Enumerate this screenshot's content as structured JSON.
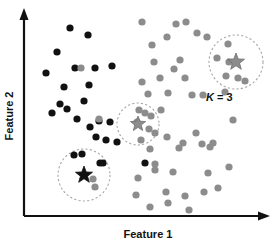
{
  "figure": {
    "title": "",
    "width": 276,
    "height": 244,
    "background": "#ffffff"
  },
  "axes": {
    "x_label": "Feature 1",
    "y_label": "Feature 2",
    "x_axis_color": "#111111",
    "y_axis_color": "#111111",
    "has_arrowheads": true,
    "has_ticks": false,
    "grid": false
  },
  "annotations": {
    "k_value": {
      "symbol": "K",
      "equals": " = ",
      "value": "3",
      "full_text": "K = 3",
      "x": 206,
      "y": 101
    }
  },
  "colors": {
    "cluster_a": "#111111",
    "cluster_b": "#8c8c8c",
    "centroid_a": "#111111",
    "centroid_b": "#8c8c8c",
    "circle_stroke": "#a8a8a8"
  },
  "chart_data": {
    "type": "scatter",
    "title": "",
    "xlabel": "Feature 1",
    "ylabel": "Feature 2",
    "xlim": [
      0,
      276
    ],
    "ylim": [
      0,
      244
    ],
    "grid": false,
    "legend": null,
    "annotations": [
      "K = 3"
    ],
    "series": [
      {
        "name": "cluster_a",
        "color": "#111111",
        "marker": "circle",
        "radius": 3.6,
        "points": [
          [
            70,
            28
          ],
          [
            88,
            35
          ],
          [
            57,
            52
          ],
          [
            46,
            73
          ],
          [
            75,
            68
          ],
          [
            95,
            68
          ],
          [
            112,
            66
          ],
          [
            64,
            87
          ],
          [
            89,
            85
          ],
          [
            60,
            104
          ],
          [
            67,
            109
          ],
          [
            84,
            101
          ],
          [
            52,
            113
          ],
          [
            77,
            119
          ],
          [
            90,
            127
          ],
          [
            99,
            121
          ],
          [
            110,
            122
          ],
          [
            96,
            137
          ],
          [
            106,
            140
          ],
          [
            117,
            142
          ],
          [
            82,
            154
          ],
          [
            103,
            163
          ],
          [
            145,
            163
          ]
        ]
      },
      {
        "name": "cluster_a_outlier_gray",
        "color": "#8c8c8c",
        "marker": "circle",
        "radius": 3.6,
        "points": [
          [
            81,
            68
          ],
          [
            99,
            119
          ],
          [
            93,
            179
          ]
        ]
      },
      {
        "name": "cluster_b",
        "color": "#8c8c8c",
        "marker": "circle",
        "radius": 3.6,
        "points": [
          [
            142,
            22
          ],
          [
            176,
            24
          ],
          [
            186,
            22
          ],
          [
            167,
            37
          ],
          [
            197,
            33
          ],
          [
            152,
            45
          ],
          [
            180,
            60
          ],
          [
            207,
            37
          ],
          [
            217,
            58
          ],
          [
            229,
            62
          ],
          [
            238,
            78
          ],
          [
            154,
            62
          ],
          [
            160,
            78
          ],
          [
            185,
            78
          ],
          [
            174,
            69
          ],
          [
            148,
            94
          ],
          [
            168,
            93
          ],
          [
            192,
            95
          ],
          [
            203,
            95
          ],
          [
            225,
            92
          ],
          [
            142,
            82
          ],
          [
            161,
            110
          ],
          [
            137,
            122
          ],
          [
            141,
            140
          ],
          [
            151,
            116
          ],
          [
            155,
            133
          ],
          [
            167,
            137
          ],
          [
            183,
            143
          ],
          [
            150,
            149
          ],
          [
            155,
            164
          ],
          [
            179,
            148
          ],
          [
            202,
            144
          ],
          [
            210,
            147
          ],
          [
            213,
            143
          ],
          [
            196,
            133
          ],
          [
            173,
            172
          ],
          [
            138,
            178
          ],
          [
            155,
            170
          ],
          [
            208,
            173
          ],
          [
            229,
            167
          ],
          [
            166,
            192
          ],
          [
            185,
            196
          ],
          [
            136,
            195
          ],
          [
            204,
            192
          ],
          [
            218,
            188
          ],
          [
            189,
            210
          ],
          [
            168,
            203
          ],
          [
            150,
            207
          ],
          [
            233,
            120
          ]
        ]
      }
    ],
    "centroids": [
      {
        "name": "centroid-bottom-left",
        "x": 84,
        "y": 175,
        "color": "#111111",
        "marker": "star",
        "size": 9,
        "circle_radius": 26
      },
      {
        "name": "centroid-middle",
        "x": 138,
        "y": 124,
        "color": "#8c8c8c",
        "marker": "star",
        "size": 8,
        "circle_radius": 21
      },
      {
        "name": "centroid-top-right",
        "x": 236,
        "y": 62,
        "color": "#8c8c8c",
        "marker": "star",
        "size": 9,
        "circle_radius": 27
      }
    ],
    "cluster_circle_points": {
      "bottom_left": [
        {
          "x": 74,
          "y": 155,
          "color": "#111111"
        },
        {
          "x": 100,
          "y": 163,
          "color": "#111111"
        },
        {
          "x": 95,
          "y": 187,
          "color": "#8c8c8c"
        }
      ],
      "middle": [
        {
          "x": 145,
          "y": 113,
          "color": "#8c8c8c"
        },
        {
          "x": 149,
          "y": 129,
          "color": "#8c8c8c"
        },
        {
          "x": 139,
          "y": 110,
          "color": "#8c8c8c"
        }
      ],
      "top_right": [
        {
          "x": 228,
          "y": 44,
          "color": "#8c8c8c"
        },
        {
          "x": 226,
          "y": 76,
          "color": "#8c8c8c"
        },
        {
          "x": 245,
          "y": 81,
          "color": "#8c8c8c"
        }
      ]
    }
  }
}
